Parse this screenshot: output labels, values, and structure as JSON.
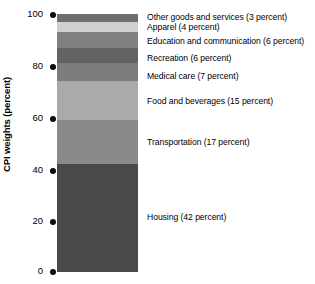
{
  "chart_data": {
    "type": "bar",
    "subtype": "stacked-single-column",
    "title": "",
    "xlabel": "",
    "ylabel": "CPI weights (percent)",
    "ylim": [
      0,
      100
    ],
    "yticks": [
      0,
      20,
      40,
      60,
      80,
      100
    ],
    "ytick_labels": [
      "0",
      "20",
      "40",
      "60",
      "80",
      "100"
    ],
    "grid": false,
    "legend_position": "right-callouts",
    "categories": [
      "Housing",
      "Transportation",
      "Food and beverages",
      "Medical care",
      "Recreation",
      "Education and communication",
      "Apparel",
      "Other goods and services"
    ],
    "values": [
      42,
      17,
      15,
      7,
      6,
      6,
      4,
      3
    ],
    "units": "percent",
    "segments": [
      {
        "name": "other-goods-and-services",
        "label": "Other goods and services (3 percent)",
        "value": 3,
        "color": "#6f6f6f",
        "cum_low": 97,
        "cum_high": 100,
        "label_top_px": 12
      },
      {
        "name": "apparel",
        "label": "Apparel (4 percent)",
        "value": 4,
        "color": "#d0d0d0",
        "cum_low": 93,
        "cum_high": 97,
        "label_top_px": 22
      },
      {
        "name": "education-and-communication",
        "label": "Education and communication (6 percent)",
        "value": 6,
        "color": "#808080",
        "cum_low": 87,
        "cum_high": 93,
        "label_top_px": 36
      },
      {
        "name": "recreation",
        "label": "Recreation (6 percent)",
        "value": 6,
        "color": "#636363",
        "cum_low": 81,
        "cum_high": 87,
        "label_top_px": 53
      },
      {
        "name": "medical-care",
        "label": "Medical care (7 percent)",
        "value": 7,
        "color": "#7c7c7c",
        "cum_low": 74,
        "cum_high": 81,
        "label_top_px": 71
      },
      {
        "name": "food-and-beverages",
        "label": "Food and beverages (15 percent)",
        "value": 15,
        "color": "#aaaaaa",
        "cum_low": 59,
        "cum_high": 74,
        "label_top_px": 96
      },
      {
        "name": "transportation",
        "label": "Transportation (17 percent)",
        "value": 17,
        "color": "#8a8a8a",
        "cum_low": 42,
        "cum_high": 59,
        "label_top_px": 137
      },
      {
        "name": "housing",
        "label": "Housing (42 percent)",
        "value": 42,
        "color": "#4a4a4a",
        "cum_low": 0,
        "cum_high": 42,
        "label_top_px": 212
      }
    ]
  },
  "axis": {
    "y_label": "CPI weights (percent)",
    "ticks": [
      {
        "value": "100",
        "top_px": 8
      },
      {
        "value": "80",
        "top_px": 60
      },
      {
        "value": "60",
        "top_px": 112
      },
      {
        "value": "40",
        "top_px": 164
      },
      {
        "value": "20",
        "top_px": 215
      },
      {
        "value": "0",
        "top_px": 265
      }
    ]
  },
  "colors": {
    "background": "#ffffff",
    "text": "#000000",
    "tick_dot": "#0b0b0b"
  }
}
